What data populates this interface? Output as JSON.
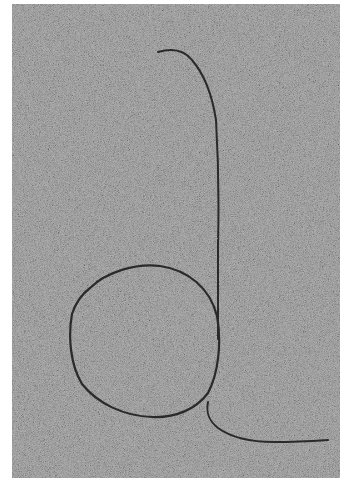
{
  "image": {
    "subject": "letter d drawn in sand",
    "background_color": "#a9a9a9",
    "stroke_color": "#2a2a2a",
    "border_color": "#ffffff"
  }
}
